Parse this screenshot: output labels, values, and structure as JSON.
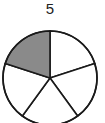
{
  "label": {
    "denominator": "5"
  },
  "diagram": {
    "type": "fraction-circle",
    "total_parts": 5,
    "shaded_parts": 1,
    "shade_color": "#8a8a8a",
    "stroke_color": "#1a1a1a",
    "fill_color": "#ffffff",
    "center": [
      50,
      78
    ],
    "radius": 47,
    "start_angle_deg": -90,
    "shaded_index": 4
  }
}
